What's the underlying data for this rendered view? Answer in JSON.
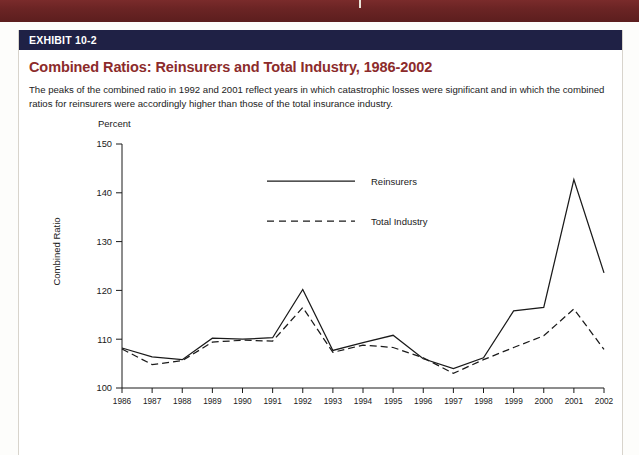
{
  "decor": {
    "top_strip_color": "#6b2424",
    "band_color": "#1f2145",
    "title_color": "#8c2b2b"
  },
  "exhibit": {
    "band_label": "EXHIBIT 10-2",
    "title": "Combined Ratios: Reinsurers and Total Industry, 1986-2002",
    "description": "The peaks of the combined ratio in 1992 and 2001 reflect years in which catastrophic losses were significant and in which the combined ratios for reinsurers were accordingly higher than those of the total insurance industry."
  },
  "chart_data": {
    "type": "line",
    "title": "Combined Ratios: Reinsurers and Total Industry, 1986-2002",
    "unit_label": "Percent",
    "xlabel": "",
    "ylabel": "Combined Ratio",
    "ylim": [
      100,
      150
    ],
    "yticks": [
      100,
      110,
      120,
      130,
      140,
      150
    ],
    "grid": false,
    "legend_position": "top-center",
    "categories": [
      1986,
      1987,
      1988,
      1989,
      1990,
      1991,
      1992,
      1993,
      1994,
      1995,
      1996,
      1997,
      1998,
      1999,
      2000,
      2001,
      2002
    ],
    "x": [
      "1986",
      "1987",
      "1988",
      "1989",
      "1990",
      "1991",
      "1992",
      "1993",
      "1994",
      "1995",
      "1996",
      "1997",
      "1998",
      "1999",
      "2000",
      "2001",
      "2002"
    ],
    "series": [
      {
        "name": "Reinsurers",
        "style": "solid",
        "color": "#1a1a1a",
        "values": [
          108.2,
          106.4,
          105.8,
          110.2,
          110.0,
          110.3,
          120.2,
          107.7,
          109.3,
          110.8,
          106.0,
          104.0,
          106.2,
          115.8,
          116.5,
          142.7,
          123.6
        ]
      },
      {
        "name": "Total Industry",
        "style": "dashed",
        "color": "#1a1a1a",
        "values": [
          108.0,
          104.8,
          105.6,
          109.4,
          109.8,
          109.6,
          116.5,
          107.3,
          108.8,
          108.3,
          106.2,
          103.0,
          105.8,
          108.3,
          110.7,
          116.2,
          107.9
        ]
      }
    ]
  }
}
